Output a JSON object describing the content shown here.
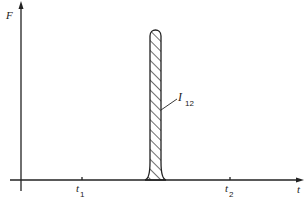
{
  "figure": {
    "y_axis_label": "F",
    "x_axis_label": "t",
    "ticks": [
      {
        "main": "t",
        "sub": "1"
      },
      {
        "main": "t",
        "sub": "2"
      }
    ],
    "pulse_label": {
      "main": "I",
      "sub": "12"
    }
  },
  "colors": {
    "ink": "#222222",
    "background": "#ffffff"
  }
}
